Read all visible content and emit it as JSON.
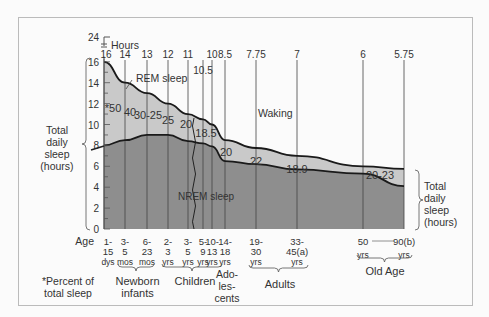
{
  "chart_data": {
    "type": "area",
    "title": "",
    "xlabel": "Age",
    "ylabel": "Total daily sleep (hours)",
    "ylim": [
      0,
      24
    ],
    "y_ticks": [
      0,
      2,
      4,
      6,
      8,
      10,
      12,
      14,
      16,
      24
    ],
    "top_axis_label": "Hours",
    "categories": [
      "1-15 dys",
      "3-5 mos",
      "6-23 mos",
      "2-3 yrs",
      "3-5 yrs",
      "5-9 yrs",
      "10-13 yrs",
      "14-18 yrs",
      "19-30 yrs",
      "33-45 yrs",
      "50 yrs",
      "90 yrs"
    ],
    "series": [
      {
        "name": "Total daily sleep (hours)",
        "values": [
          16,
          14,
          13,
          12,
          11,
          10.5,
          10,
          8.5,
          7.75,
          7,
          6,
          5.75
        ]
      },
      {
        "name": "NREM sleep (hours, approx.)",
        "values": [
          8,
          8.5,
          9,
          9,
          8.4,
          8.2,
          7.9,
          6.5,
          6.2,
          5.7,
          5.3,
          4.1
        ]
      },
      {
        "name": "REM sleep (% of total sleep)",
        "values": [
          "50",
          "40",
          "30-25",
          "25",
          "20",
          "18.5",
          "",
          "20",
          "22",
          "18.9",
          "20-23",
          ""
        ]
      }
    ],
    "region_labels": [
      "REM sleep",
      "NREM sleep",
      "Waking"
    ],
    "groups": [
      {
        "name": "Newborn infants",
        "span": [
          "3-5 mos",
          "6-23 mos"
        ]
      },
      {
        "name": "Children",
        "span": [
          "2-3 yrs",
          "10-13 yrs"
        ]
      },
      {
        "name": "Adolescents",
        "span": [
          "14-18 yrs"
        ]
      },
      {
        "name": "Adults",
        "span": [
          "19-30 yrs",
          "33-45 yrs"
        ]
      },
      {
        "name": "Old Age",
        "span": [
          "50 yrs",
          "90 yrs"
        ]
      }
    ],
    "footnote": "*Percent of total sleep",
    "grid": false,
    "legend_position": "none"
  },
  "axis": {
    "age_label": "Age",
    "hours_label": "Hours",
    "y_left_title": [
      "Total",
      "daily",
      "sleep",
      "(hours)"
    ],
    "y_right_title": [
      "Total",
      "daily",
      "sleep",
      "(hours)"
    ],
    "top_values": [
      "16",
      "14",
      "13",
      "12",
      "11",
      "10.5",
      "10",
      "8.5",
      "7.75",
      "7",
      "6",
      "5.75"
    ],
    "ages": [
      [
        "1-",
        "15",
        "dys"
      ],
      [
        "3-",
        "5",
        "mos"
      ],
      [
        "6-",
        "23",
        "mos"
      ],
      [
        "2-",
        "3",
        "yrs"
      ],
      [
        "3-",
        "5",
        "yrs"
      ],
      [
        "5-",
        "9",
        "yrs"
      ],
      [
        "10-",
        "13",
        "yrs"
      ],
      [
        "14-",
        "18",
        "yrs"
      ],
      [
        "19-",
        "30",
        "yrs"
      ],
      [
        "33-",
        "45(a)",
        "yrs"
      ],
      [
        "50",
        "",
        "yrs"
      ],
      [
        "90(b)",
        "",
        "yrs"
      ]
    ]
  },
  "labels": {
    "rem": "REM sleep",
    "nrem": "NREM sleep",
    "waking": "Waking",
    "footnote_1": "*Percent of",
    "footnote_2": "total sleep",
    "newborn_1": "Newborn",
    "newborn_2": "infants",
    "children": "Children",
    "adol_1": "Ado-",
    "adol_2": "les-",
    "adol_3": "cents",
    "adults": "Adults",
    "old_age": "Old Age"
  },
  "colors": {
    "rem": "#c9c9c9",
    "nrem": "#8e8e8e",
    "line": "#1a1a1a"
  }
}
